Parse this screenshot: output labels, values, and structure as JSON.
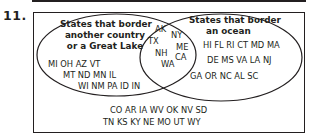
{
  "problem_number": "11.",
  "diagram": {
    "type": "venn",
    "left_set": {
      "title_lines": [
        "States that border",
        "another country",
        "or a Great Lake"
      ],
      "only_rows": [
        "MI OH AZ VT",
        "MT ND MN IL",
        "WI NM PA ID IN"
      ]
    },
    "right_set": {
      "title_lines": [
        "States that border",
        "an ocean"
      ],
      "only_rows": [
        "HI FL RI CT MD MA",
        "DE MS VA LA NJ",
        "GA OR NC AL SC"
      ]
    },
    "intersection": [
      "AK",
      "NY",
      "TX",
      "ME",
      "NH",
      "CA",
      "WA"
    ],
    "outside_rows": [
      "CO AR IA WV OK NV SD",
      "TN KS KY NE MO UT WY"
    ],
    "colors": {
      "ink": "#231f20",
      "background": "#ffffff"
    }
  }
}
